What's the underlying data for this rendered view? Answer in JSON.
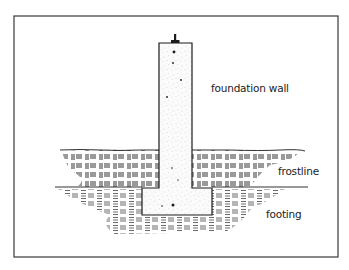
{
  "diagram": {
    "title": "",
    "colors": {
      "ink": "#1c1c1c",
      "frame": "#3a3a3a",
      "concrete_fill": "#fbfbfb",
      "background": "#ffffff"
    },
    "frame": {
      "x": 14,
      "y": 16,
      "width": 324,
      "height": 241
    },
    "elements": {
      "foundation_wall": {
        "x": 159,
        "y": 43,
        "width": 33,
        "height": 145
      },
      "footing": {
        "x": 142,
        "y": 188,
        "width": 70,
        "height": 27
      },
      "anchor_bolt": {
        "x": 175,
        "top": 34,
        "bottom": 43
      },
      "ground_line": {
        "y": 150,
        "x_start": 60,
        "x_end": 305
      },
      "frost_line": {
        "y": 187,
        "x_start": 55,
        "x_end": 308
      }
    },
    "labels": {
      "foundation_wall": "foundation wall",
      "frostline": "frostline",
      "footing": "footing"
    }
  }
}
